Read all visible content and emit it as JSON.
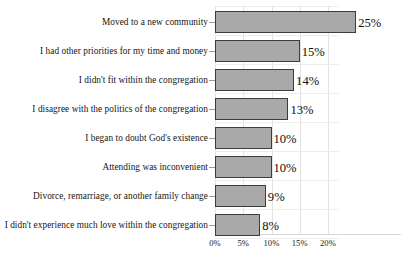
{
  "chart_data": {
    "type": "bar",
    "orientation": "horizontal",
    "title": "",
    "subtitle": "",
    "xlabel": "",
    "ylabel": "",
    "xlim": [
      0,
      22
    ],
    "xtick_values": [
      0,
      5,
      10,
      15,
      20
    ],
    "xtick_labels": [
      "0%",
      "5%",
      "10%",
      "15%",
      "20%"
    ],
    "grid": true,
    "legend": null,
    "value_suffix": "%",
    "categories": [
      "Moved to a new community",
      "I had other priorities for my time and money",
      "I didn't fit within the congregation",
      "I disagree with the politics of the congregation",
      "I began to doubt God's existence",
      "Attending was inconvenient",
      "Divorce, remarriage, or another family change",
      "I didn't experience much love within the congregation"
    ],
    "values": [
      25,
      15,
      14,
      13,
      10,
      10,
      9,
      8
    ],
    "value_labels": [
      "25%",
      "15%",
      "14%",
      "13%",
      "10%",
      "10%",
      "9%",
      "8%"
    ],
    "colors": {
      "bar_fill": "#a9a9a9",
      "bar_border": "#3c3c3c",
      "grid": "#e2e2e2",
      "text": "#151515",
      "background": "#ffffff"
    }
  }
}
